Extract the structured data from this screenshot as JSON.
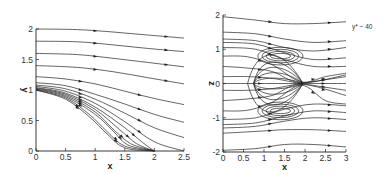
{
  "chart_data": [
    {
      "type": "line",
      "subtype": "streamlines",
      "title": "",
      "xlabel": "x",
      "ylabel": "y",
      "xlim": [
        0,
        2.5
      ],
      "ylim": [
        0,
        2
      ],
      "xticks": [
        "0",
        "0.5",
        "1",
        "1.5",
        "2",
        "2.5"
      ],
      "yticks": [
        "0",
        "0.5",
        "1",
        "1.5",
        "2"
      ],
      "grid": false,
      "legend": null,
      "series": [
        {
          "name": "s1",
          "x": [
            0,
            0.7,
            1.3,
            1.9,
            2.5
          ],
          "y": [
            2.0,
            1.99,
            1.95,
            1.9,
            1.85
          ]
        },
        {
          "name": "s2",
          "x": [
            0,
            0.7,
            1.3,
            1.9,
            2.5
          ],
          "y": [
            1.8,
            1.79,
            1.74,
            1.68,
            1.63
          ]
        },
        {
          "name": "s3",
          "x": [
            0,
            0.7,
            1.3,
            1.9,
            2.5
          ],
          "y": [
            1.6,
            1.58,
            1.52,
            1.45,
            1.38
          ]
        },
        {
          "name": "s4",
          "x": [
            0,
            0.7,
            1.3,
            1.9,
            2.5
          ],
          "y": [
            1.4,
            1.37,
            1.3,
            1.2,
            1.1
          ]
        },
        {
          "name": "s5",
          "x": [
            0,
            0.5,
            1.0,
            1.5,
            2.0,
            2.5
          ],
          "y": [
            1.22,
            1.18,
            1.1,
            0.98,
            0.86,
            0.76
          ]
        },
        {
          "name": "s6",
          "x": [
            0,
            0.5,
            1.0,
            1.5,
            2.0,
            2.5
          ],
          "y": [
            1.12,
            1.07,
            0.93,
            0.77,
            0.6,
            0.47
          ]
        },
        {
          "name": "s7",
          "x": [
            0,
            0.5,
            1.0,
            1.5,
            2.0,
            2.5
          ],
          "y": [
            1.08,
            1.02,
            0.85,
            0.62,
            0.38,
            0.22
          ]
        },
        {
          "name": "s8",
          "x": [
            0,
            0.5,
            1.0,
            1.5,
            2.0,
            2.5
          ],
          "y": [
            1.06,
            0.98,
            0.78,
            0.48,
            0.15,
            0.0
          ]
        },
        {
          "name": "s9",
          "x": [
            0,
            0.5,
            1.0,
            1.5,
            1.8,
            2.0
          ],
          "y": [
            1.04,
            0.95,
            0.72,
            0.38,
            0.14,
            0.0
          ]
        },
        {
          "name": "s10",
          "x": [
            0,
            0.5,
            1.0,
            1.4,
            1.7,
            2.0
          ],
          "y": [
            1.03,
            0.93,
            0.68,
            0.36,
            0.12,
            0.0
          ]
        },
        {
          "name": "s11",
          "x": [
            0,
            0.5,
            1.0,
            1.3,
            1.6,
            2.0
          ],
          "y": [
            1.02,
            0.91,
            0.64,
            0.36,
            0.12,
            0.0
          ]
        },
        {
          "name": "s12",
          "x": [
            0,
            0.5,
            1.0,
            1.3,
            1.55,
            2.0
          ],
          "y": [
            1.01,
            0.89,
            0.6,
            0.33,
            0.1,
            0.0
          ]
        },
        {
          "name": "s13",
          "x": [
            0,
            0.5,
            0.9,
            1.2,
            1.5,
            2.0
          ],
          "y": [
            1.0,
            0.87,
            0.6,
            0.32,
            0.08,
            0.0
          ]
        },
        {
          "name": "s14",
          "x": [
            0,
            0.5,
            0.9,
            1.2,
            1.5,
            2.0
          ],
          "y": [
            1.0,
            0.85,
            0.56,
            0.28,
            0.05,
            0.0
          ]
        }
      ]
    },
    {
      "type": "line",
      "subtype": "streamlines",
      "title": "",
      "xlabel": "x",
      "ylabel": "z",
      "xlim": [
        0,
        3
      ],
      "ylim": [
        -2,
        2
      ],
      "xticks": [
        "0",
        "0.5",
        "1",
        "1.5",
        "2",
        "2.5",
        "3"
      ],
      "yticks": [
        "-2",
        "-1",
        "0",
        "1",
        "2"
      ],
      "grid": false,
      "legend": null,
      "annotations": [
        {
          "text": "y* ~ 40",
          "x": 3.1,
          "z": 1.6
        }
      ],
      "series": [
        {
          "name": "outer-top",
          "x": [
            0,
            0.8,
            1.5,
            2.2,
            3.0
          ],
          "y": [
            1.95,
            1.85,
            1.75,
            1.75,
            1.8
          ]
        },
        {
          "name": "t2",
          "x": [
            0,
            0.8,
            1.5,
            2.2,
            3.0
          ],
          "y": [
            1.5,
            1.45,
            1.3,
            1.2,
            1.25
          ]
        },
        {
          "name": "t3",
          "x": [
            0,
            0.8,
            1.5,
            2.2,
            3.0
          ],
          "y": [
            1.3,
            1.25,
            1.05,
            0.95,
            1.05
          ]
        },
        {
          "name": "t4",
          "x": [
            0,
            0.8,
            1.5,
            2.2,
            3.0
          ],
          "y": [
            1.2,
            1.15,
            0.9,
            0.7,
            0.75
          ]
        },
        {
          "name": "t5",
          "x": [
            0,
            0.8,
            1.5,
            2.2,
            3.0
          ],
          "y": [
            1.05,
            1.0,
            0.7,
            0.5,
            0.5
          ]
        },
        {
          "name": "t6",
          "x": [
            0,
            0.6,
            1.2,
            1.9,
            2.5,
            3.0
          ],
          "y": [
            0.8,
            0.78,
            0.55,
            0.05,
            0.2,
            0.3
          ]
        },
        {
          "name": "t7",
          "x": [
            0,
            0.6,
            1.2,
            1.9,
            3.0
          ],
          "y": [
            0.5,
            0.45,
            0.35,
            0.02,
            0.25
          ]
        },
        {
          "name": "t8",
          "x": [
            0,
            0.6,
            1.2,
            1.9,
            3.0
          ],
          "y": [
            0.2,
            0.2,
            0.15,
            0.0,
            -0.2
          ]
        },
        {
          "name": "c0",
          "x": [
            0,
            0.6,
            1.2,
            1.9,
            3.0
          ],
          "y": [
            0.0,
            0.0,
            0.0,
            0.0,
            0.0
          ]
        },
        {
          "name": "b8",
          "x": [
            0,
            0.6,
            1.2,
            1.9,
            3.0
          ],
          "y": [
            -0.2,
            -0.2,
            -0.15,
            0.0,
            0.2
          ]
        },
        {
          "name": "b7",
          "x": [
            0,
            0.6,
            1.2,
            1.9,
            3.0
          ],
          "y": [
            -0.5,
            -0.45,
            -0.35,
            -0.02,
            -0.35
          ]
        },
        {
          "name": "b6",
          "x": [
            0,
            0.6,
            1.2,
            1.9,
            2.5,
            3.0
          ],
          "y": [
            -0.8,
            -0.78,
            -0.55,
            -0.05,
            -0.5,
            -0.6
          ]
        },
        {
          "name": "b5",
          "x": [
            0,
            0.8,
            1.5,
            2.2,
            3.0
          ],
          "y": [
            -1.05,
            -1.0,
            -0.75,
            -0.6,
            -0.65
          ]
        },
        {
          "name": "b4",
          "x": [
            0,
            0.8,
            1.5,
            2.2,
            3.0
          ],
          "y": [
            -1.2,
            -1.15,
            -0.95,
            -0.8,
            -0.85
          ]
        },
        {
          "name": "b3",
          "x": [
            0,
            0.8,
            1.5,
            2.2,
            3.0
          ],
          "y": [
            -1.3,
            -1.25,
            -1.1,
            -1.0,
            -1.05
          ]
        },
        {
          "name": "b2",
          "x": [
            0,
            0.8,
            1.5,
            2.2,
            3.0
          ],
          "y": [
            -1.45,
            -1.4,
            -1.35,
            -1.35,
            -1.4
          ]
        },
        {
          "name": "outer-bottom",
          "x": [
            0,
            0.8,
            1.5,
            2.2,
            3.0
          ],
          "y": [
            -1.95,
            -1.9,
            -1.78,
            -1.78,
            -1.85
          ]
        }
      ],
      "vortices": [
        {
          "name": "upper-vortex",
          "cx": 1.4,
          "cz": 0.8,
          "rx": [
            0.25,
            0.35,
            0.45,
            0.55
          ],
          "rz": [
            0.08,
            0.14,
            0.2,
            0.26
          ]
        },
        {
          "name": "lower-vortex",
          "cx": 1.4,
          "cz": -0.8,
          "rx": [
            0.25,
            0.35,
            0.45,
            0.55
          ],
          "rz": [
            0.08,
            0.14,
            0.2,
            0.26
          ]
        }
      ],
      "separation_bubble": {
        "x0": 0.6,
        "x1": 1.95,
        "z_half": 1.05
      }
    }
  ]
}
